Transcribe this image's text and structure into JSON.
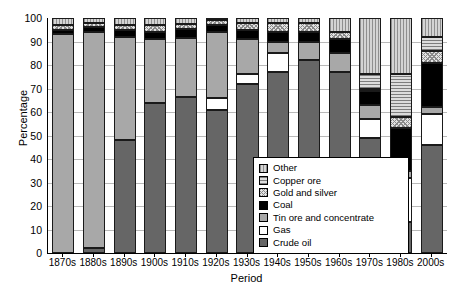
{
  "chart_data": {
    "type": "bar",
    "subtype": "stacked-bar-100pct",
    "title": "",
    "xlabel": "Period",
    "ylabel": "Percentage",
    "ylim": [
      0,
      100
    ],
    "ytick_step": 10,
    "yticks": [
      0,
      10,
      20,
      30,
      40,
      50,
      60,
      70,
      80,
      90,
      100
    ],
    "grid": true,
    "grid_axis": "y",
    "legend_position": "inside-right-lower",
    "categories": [
      "1870s",
      "1880s",
      "1890s",
      "1900s",
      "1910s",
      "1920s",
      "1930s",
      "1940s",
      "1950s",
      "1960s",
      "1970s",
      "1980s",
      "2000s"
    ],
    "series": [
      {
        "name": "Crude oil",
        "color": "#666666",
        "pattern": "solid-dark-gray",
        "values": [
          0,
          2,
          48,
          64,
          66.5,
          61,
          72,
          77,
          82,
          77,
          49,
          13,
          46
        ]
      },
      {
        "name": "Gas",
        "color": "#ffffff",
        "pattern": "solid-white",
        "values": [
          0,
          0,
          0,
          0,
          0,
          5,
          4,
          8,
          0,
          0,
          8,
          19,
          13
        ]
      },
      {
        "name": "Tin ore and concentrate",
        "color": "#a8a8a8",
        "pattern": "solid-medium-gray",
        "values": [
          93,
          92,
          44,
          27,
          25,
          28,
          15,
          5,
          8,
          8,
          6,
          3,
          3
        ]
      },
      {
        "name": "Coal",
        "color": "#000000",
        "pattern": "solid-black",
        "values": [
          2,
          2,
          3,
          3,
          4,
          3,
          4,
          4,
          4,
          6,
          6,
          18,
          19
        ]
      },
      {
        "name": "Gold and silver",
        "color": "#e2e2e2",
        "pattern": "cross-hatch",
        "values": [
          2,
          2,
          2,
          3,
          2,
          2,
          3,
          4,
          4,
          3,
          1,
          5,
          5
        ]
      },
      {
        "name": "Copper ore",
        "color": "#dcdcdc",
        "pattern": "horizontal-stripes",
        "values": [
          0,
          0,
          0,
          0,
          0,
          0,
          0,
          0,
          0,
          0,
          6,
          18,
          6
        ]
      },
      {
        "name": "Other",
        "color": "#d4d4d4",
        "pattern": "vertical-stripes",
        "values": [
          3,
          2,
          3,
          3,
          2.5,
          1,
          2,
          2,
          2,
          6,
          24,
          24,
          8
        ]
      }
    ]
  },
  "legend": {
    "items": [
      {
        "label": "Other",
        "key": "other"
      },
      {
        "label": "Copper ore",
        "key": "copper"
      },
      {
        "label": "Gold and silver",
        "key": "gold"
      },
      {
        "label": "Coal",
        "key": "coal"
      },
      {
        "label": "Tin ore and concentrate",
        "key": "tin"
      },
      {
        "label": "Gas",
        "key": "gas"
      },
      {
        "label": "Crude oil",
        "key": "oil"
      }
    ]
  }
}
